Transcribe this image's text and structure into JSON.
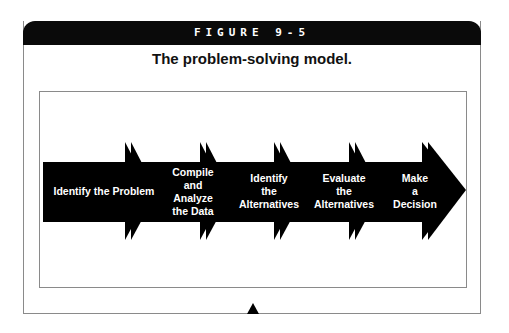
{
  "figure": {
    "label": "FIGURE 9-5",
    "title": "The problem-solving model."
  },
  "steps": [
    {
      "label": "Identify the Problem"
    },
    {
      "label": "Compile and Analyze the Data",
      "lines": [
        "Compile",
        "and",
        "Analyze",
        "the Data"
      ]
    },
    {
      "label": "Identify the Alternatives",
      "lines": [
        "Identify",
        "the",
        "Alternatives"
      ]
    },
    {
      "label": "Evaluate the Alternatives",
      "lines": [
        "Evaluate",
        "the",
        "Alternatives"
      ]
    },
    {
      "label": "Make a Decision",
      "lines": [
        "Make",
        "a",
        "Decision"
      ]
    }
  ],
  "colors": {
    "header_bg": "#0a0a0a",
    "arrow_fill": "#000000",
    "border": "#8a8a8a"
  }
}
